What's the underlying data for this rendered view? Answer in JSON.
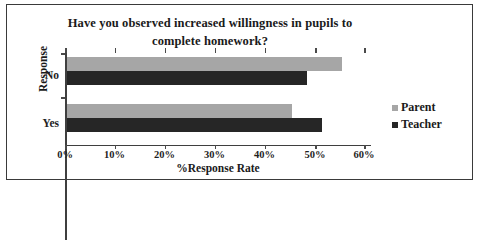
{
  "chart_data": {
    "type": "bar",
    "orientation": "horizontal",
    "title": "Have you observed increased willingness in pupils to complete homework?",
    "title_lines": [
      "Have you observed increased willingness in pupils to",
      "complete homework?"
    ],
    "xlabel": "%Response Rate",
    "ylabel": "Response",
    "categories": [
      "Yes",
      "No"
    ],
    "series": [
      {
        "name": "Parent",
        "color": "#a6a6a6",
        "values": [
          45,
          55
        ]
      },
      {
        "name": "Teacher",
        "color": "#262626",
        "values": [
          51,
          48
        ]
      }
    ],
    "xlim": [
      0,
      60
    ],
    "xticks": [
      0,
      10,
      20,
      30,
      40,
      50,
      60
    ],
    "xtick_labels": [
      "0%",
      "10%",
      "20%",
      "30%",
      "40%",
      "50%",
      "60%"
    ],
    "grid": true,
    "gridlines_at": [
      0,
      50,
      60
    ],
    "legend_position": "right"
  },
  "legend": {
    "entries": [
      {
        "label": "Parent",
        "marker": "square-swatch-gray"
      },
      {
        "label": "Teacher",
        "marker": "square-swatch-dark"
      }
    ]
  }
}
